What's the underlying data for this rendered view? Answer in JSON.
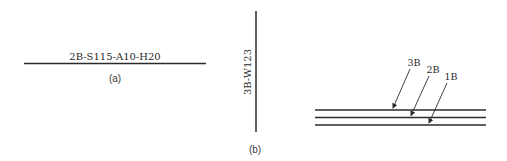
{
  "figure_a": {
    "label": "2B-S115-A10-H20",
    "caption": "(a)"
  },
  "figure_b": {
    "vertical_label": "3B-W123",
    "caption": "(b)",
    "layers": [
      {
        "label": "3B"
      },
      {
        "label": "2B"
      },
      {
        "label": "1B"
      }
    ]
  },
  "colors": {
    "line": "#2b2b2b",
    "text": "#2a2a2a",
    "background": "#ffffff"
  }
}
